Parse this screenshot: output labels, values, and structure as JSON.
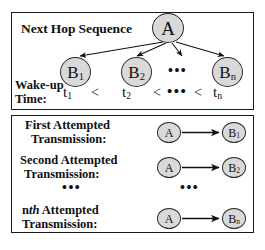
{
  "figure": {
    "title_semantic": "next-hop-sequence-and-attempted-transmissions-diagram"
  },
  "top_panel": {
    "heading": "Next Hop Sequence",
    "wakeup_label_line1": "Wake-up",
    "wakeup_label_line2": "Time:",
    "source_node": "A",
    "dest_nodes": [
      {
        "base": "B",
        "sub": "1"
      },
      {
        "base": "B",
        "sub": "2"
      },
      {
        "base": "B",
        "sub": "n"
      }
    ],
    "ellipsis_nodes": "•••",
    "time_sequence": {
      "t1": {
        "base": "t",
        "sub": "1"
      },
      "t2": {
        "base": "t",
        "sub": "2"
      },
      "tn": {
        "base": "t",
        "sub": "n"
      },
      "operator1": "<",
      "operator2": "<",
      "operator3": "<",
      "ellipsis": "•••"
    }
  },
  "bottom_panel": {
    "rows": [
      {
        "label_line1": "First Attempted",
        "label_line2": "Transmission:",
        "from": "A",
        "to_base": "B",
        "to_sub": "1"
      },
      {
        "label_line1": "Second Attempted",
        "label_line2": "Transmission:",
        "from": "A",
        "to_base": "B",
        "to_sub": "2"
      },
      {
        "label_prefix": "n",
        "label_italic": "th",
        "label_line1_rest": " Attempted",
        "label_line2": "Transmission:",
        "from": "A",
        "to_base": "B",
        "to_sub": "n"
      }
    ],
    "ellipsis_left": "•••",
    "ellipsis_right": "•••"
  },
  "colors": {
    "node_fill": "#d9d9d9",
    "node_stroke": "#2b2b2b",
    "panel_border": "#1a1a1a",
    "text": "#111111",
    "background": "#ffffff"
  }
}
